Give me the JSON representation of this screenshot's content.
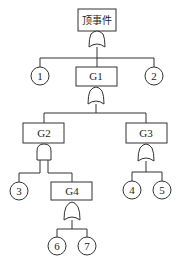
{
  "diagram": {
    "type": "fault-tree",
    "top_event": {
      "id": "top",
      "label": "顶事件",
      "gate": "OR"
    },
    "gates": [
      {
        "id": "G1",
        "label": "G1",
        "gate": "OR",
        "parent": "top"
      },
      {
        "id": "G2",
        "label": "G2",
        "gate": "AND",
        "parent": "G1"
      },
      {
        "id": "G3",
        "label": "G3",
        "gate": "OR",
        "parent": "G1"
      },
      {
        "id": "G4",
        "label": "G4",
        "gate": "OR",
        "parent": "G2"
      }
    ],
    "basic_events": [
      {
        "id": "e1",
        "label": "1",
        "parent": "top"
      },
      {
        "id": "e2",
        "label": "2",
        "parent": "top"
      },
      {
        "id": "e3",
        "label": "3",
        "parent": "G2"
      },
      {
        "id": "e4",
        "label": "4",
        "parent": "G3"
      },
      {
        "id": "e5",
        "label": "5",
        "parent": "G3"
      },
      {
        "id": "e6",
        "label": "6",
        "parent": "G4"
      },
      {
        "id": "e7",
        "label": "7",
        "parent": "G4"
      }
    ]
  }
}
